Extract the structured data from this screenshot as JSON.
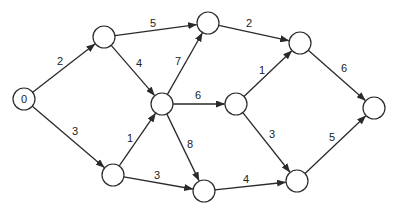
{
  "diagram": {
    "type": "directed-weighted-graph",
    "colors": {
      "stroke": "#2a2a2a",
      "background": "#ffffff",
      "text": "#222222"
    },
    "node_radius": 11,
    "nodes": [
      {
        "id": "n0",
        "label": "0",
        "x": 24,
        "y": 99
      },
      {
        "id": "n1",
        "label": "",
        "x": 104,
        "y": 37
      },
      {
        "id": "n2",
        "label": "",
        "x": 208,
        "y": 23
      },
      {
        "id": "n3",
        "label": "",
        "x": 162,
        "y": 104
      },
      {
        "id": "n4",
        "label": "",
        "x": 236,
        "y": 104
      },
      {
        "id": "n5",
        "label": "",
        "x": 300,
        "y": 43
      },
      {
        "id": "n6",
        "label": "",
        "x": 374,
        "y": 108
      },
      {
        "id": "n7",
        "label": "",
        "x": 113,
        "y": 175
      },
      {
        "id": "n8",
        "label": "",
        "x": 204,
        "y": 191
      },
      {
        "id": "n9",
        "label": "",
        "x": 297,
        "y": 181
      }
    ],
    "edges": [
      {
        "from": "n0",
        "to": "n1",
        "weight": "2",
        "lx": 60,
        "ly": 61
      },
      {
        "from": "n0",
        "to": "n7",
        "weight": "3",
        "lx": 75,
        "ly": 131
      },
      {
        "from": "n1",
        "to": "n2",
        "weight": "5",
        "lx": 153,
        "ly": 23
      },
      {
        "from": "n1",
        "to": "n3",
        "weight": "4",
        "lx": 139,
        "ly": 63
      },
      {
        "from": "n7",
        "to": "n3",
        "weight": "1",
        "lx": 130,
        "ly": 138
      },
      {
        "from": "n7",
        "to": "n8",
        "weight": "3",
        "lx": 157,
        "ly": 175
      },
      {
        "from": "n3",
        "to": "n2",
        "weight": "7",
        "lx": 178,
        "ly": 61
      },
      {
        "from": "n3",
        "to": "n4",
        "weight": "6",
        "lx": 198,
        "ly": 95
      },
      {
        "from": "n3",
        "to": "n8",
        "weight": "8",
        "lx": 190,
        "ly": 144
      },
      {
        "from": "n2",
        "to": "n5",
        "weight": "2",
        "lx": 249,
        "ly": 23
      },
      {
        "from": "n4",
        "to": "n5",
        "weight": "1",
        "lx": 262,
        "ly": 70
      },
      {
        "from": "n4",
        "to": "n9",
        "weight": "3",
        "lx": 272,
        "ly": 134
      },
      {
        "from": "n8",
        "to": "n9",
        "weight": "4",
        "lx": 246,
        "ly": 179
      },
      {
        "from": "n5",
        "to": "n6",
        "weight": "6",
        "lx": 344,
        "ly": 68
      },
      {
        "from": "n9",
        "to": "n6",
        "weight": "5",
        "lx": 332,
        "ly": 137
      }
    ]
  }
}
